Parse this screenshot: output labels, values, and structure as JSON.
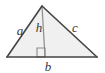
{
  "figure": {
    "type": "geometry-diagram",
    "shape": "triangle",
    "background_color": "#ffffff",
    "fill_color": "#f0f0f0",
    "stroke_color": "#444444",
    "altitude_stroke_color": "#8c8c8c",
    "label_color": "#3a3a3a",
    "canvas": {
      "width": 105,
      "height": 73
    },
    "vertices": {
      "apex": {
        "x": 42,
        "y": 6
      },
      "bottom_left": {
        "x": 7,
        "y": 57
      },
      "bottom_right": {
        "x": 97,
        "y": 57
      }
    },
    "altitude": {
      "from": {
        "x": 42,
        "y": 6
      },
      "to": {
        "x": 45,
        "y": 57
      }
    },
    "right_angle_marker": {
      "x": 37,
      "y": 48,
      "width": 8,
      "height": 9
    },
    "labels": [
      {
        "name": "side-a",
        "text": "a",
        "x": 20,
        "y": 35,
        "meaning": "left side"
      },
      {
        "name": "altitude-h",
        "text": "h",
        "x": 39,
        "y": 32,
        "meaning": "height / altitude"
      },
      {
        "name": "side-c",
        "text": "c",
        "x": 75,
        "y": 32,
        "meaning": "right side"
      },
      {
        "name": "base-b",
        "text": "b",
        "x": 48,
        "y": 71,
        "meaning": "base"
      }
    ]
  }
}
